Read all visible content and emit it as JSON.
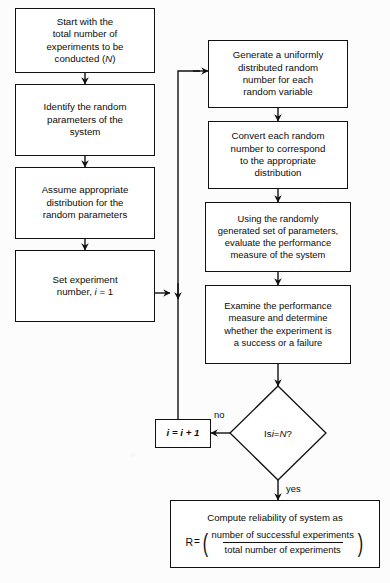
{
  "diagram": {
    "background_color": "#fcfcfc",
    "line_color": "#111111",
    "text_color": "#0b0b0b"
  },
  "nodes": {
    "start": {
      "id": "start",
      "shape": "process",
      "text": "Start with the\ntotal number of\nexperiments to be\nconducted (N)"
    },
    "identify": {
      "id": "identify",
      "shape": "process",
      "text": "Identify the random\nparameters of the\nsystem"
    },
    "assume": {
      "id": "assume",
      "shape": "process",
      "text": "Assume appropriate\ndistribution for the\nrandom parameters"
    },
    "set_experiment": {
      "id": "set_experiment",
      "shape": "process",
      "text": "Set experiment\nnumber, i = 1"
    },
    "generate": {
      "id": "generate",
      "shape": "process",
      "text": "Generate a uniformly\ndistributed random\nnumber for each\nrandom variable"
    },
    "convert": {
      "id": "convert",
      "shape": "process",
      "text": "Convert each random\nnumber to correspond\nto the appropriate\ndistribution"
    },
    "evaluate": {
      "id": "evaluate",
      "shape": "process",
      "text": "Using the randomly\ngenerated set of parameters,\nevaluate the performance\nmeasure of the system"
    },
    "examine": {
      "id": "examine",
      "shape": "process",
      "text": "Examine the performance\nmeasure and determine\nwhether the experiment is\na success or a failure"
    },
    "decision": {
      "id": "decision",
      "shape": "diamond",
      "text": "Is i = N?"
    },
    "increment": {
      "id": "increment",
      "shape": "process",
      "text": "i = i + 1"
    },
    "compute": {
      "id": "compute",
      "shape": "process",
      "line1": "Compute reliability of system as",
      "formula_lhs": "R",
      "formula_eq": "=",
      "formula_numerator": "number of successful experiments",
      "formula_denominator": "total number of experiments",
      "paren_open": "(",
      "paren_close": ")"
    }
  },
  "edge_labels": {
    "no": "no",
    "yes": "yes"
  }
}
